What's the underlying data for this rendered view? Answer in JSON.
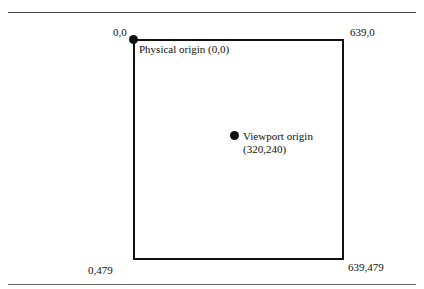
{
  "diagram": {
    "corners": {
      "top_left": "0,0",
      "top_right": "639,0",
      "bottom_left": "0,479",
      "bottom_right": "639,479"
    },
    "physical_origin": {
      "label": "Physical origin (0,0)"
    },
    "viewport_origin": {
      "label_line1": "Viewport origin",
      "label_line2": "(320,240)"
    },
    "colors": {
      "stroke": "#111111",
      "background": "#ffffff"
    }
  }
}
